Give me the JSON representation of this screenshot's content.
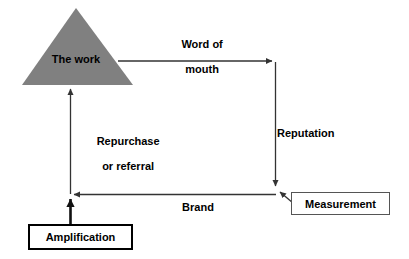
{
  "diagram": {
    "background_color": "#ffffff",
    "line_color": "#333333",
    "triangle_fill": "#808080",
    "text_color": "#000000",
    "shapes": {
      "triangle": {
        "label": "The work",
        "fill": "#808080",
        "apex": [
          76,
          8
        ],
        "base_left": [
          22,
          85
        ],
        "base_right": [
          133,
          85
        ]
      },
      "amplification_box": {
        "label": "Amplification",
        "border_color": "#000000",
        "border_width": 2,
        "fill": "#ffffff"
      },
      "measurement_box": {
        "label": "Measurement",
        "border_color": "#555555",
        "border_width": 1,
        "fill": "#ffffff"
      }
    },
    "arrows": [
      {
        "name": "word-of-mouth",
        "label": "Word of\nmouth",
        "label_line_1": "Word of",
        "label_line_2": "mouth",
        "from": "The work",
        "to": "Reputation corner",
        "direction": "right"
      },
      {
        "name": "reputation",
        "label": "Reputation",
        "from": "Word of mouth corner",
        "to": "Brand corner",
        "direction": "down"
      },
      {
        "name": "brand",
        "label": "Brand",
        "from": "Measurement corner",
        "to": "Repurchase corner",
        "direction": "left"
      },
      {
        "name": "repurchase-or-referral",
        "label": "Repurchase\nor referral",
        "label_line_1": "Repurchase",
        "label_line_2": "or referral",
        "from": "Brand corner",
        "to": "The work",
        "direction": "up"
      },
      {
        "name": "amplification",
        "label": "",
        "from": "Amplification",
        "to": "Brand corner",
        "direction": "up"
      },
      {
        "name": "measurement-leader",
        "label": "",
        "from": "Measurement",
        "to": "Brand corner",
        "direction": "up-left"
      }
    ]
  },
  "labels": {
    "the_work": "The work",
    "word_of_mouth_line1": "Word of",
    "word_of_mouth_line2": "mouth",
    "repurchase_line1": "Repurchase",
    "repurchase_line2": "or referral",
    "reputation": "Reputation",
    "brand": "Brand",
    "amplification": "Amplification",
    "measurement": "Measurement"
  }
}
